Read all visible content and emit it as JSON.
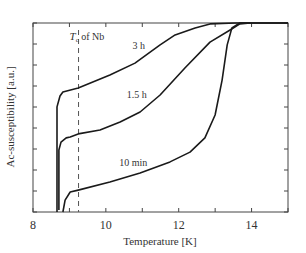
{
  "chart_data": {
    "type": "line",
    "title": "",
    "xlabel": "Temperature [K]",
    "ylabel": "Ac-susceptibility [a.u.]",
    "xlim": [
      8,
      15
    ],
    "ylim": [
      0,
      1
    ],
    "x_ticks": [
      8,
      10,
      12,
      14
    ],
    "x_minor_ticks": [
      9,
      11,
      13,
      15
    ],
    "y_ticks_count": 10,
    "y_tick_labels": [],
    "grid": false,
    "legend": null,
    "annotations": [
      {
        "text_main": "T",
        "text_sub": "c",
        "text_rest": " of Nb",
        "x": 9.25,
        "style": "vertical dashed line"
      },
      {
        "text": "3 h",
        "x": 10.9,
        "y": 0.86
      },
      {
        "text": "1.5 h",
        "x": 10.85,
        "y": 0.605
      },
      {
        "text": "10 min",
        "x": 10.75,
        "y": 0.245
      }
    ],
    "series": [
      {
        "name": "3 h",
        "points": [
          [
            8.66,
            0
          ],
          [
            8.66,
            0.556
          ],
          [
            8.74,
            0.614
          ],
          [
            8.82,
            0.635
          ],
          [
            9.24,
            0.656
          ],
          [
            10.11,
            0.725
          ],
          [
            10.8,
            0.788
          ],
          [
            11.49,
            0.884
          ],
          [
            11.9,
            0.937
          ],
          [
            12.45,
            0.974
          ],
          [
            12.86,
            0.995
          ],
          [
            13.55,
            1.0
          ],
          [
            15.0,
            1.0
          ]
        ]
      },
      {
        "name": "1.5 h",
        "points": [
          [
            8.71,
            0.01
          ],
          [
            8.71,
            0.328
          ],
          [
            8.77,
            0.37
          ],
          [
            8.91,
            0.392
          ],
          [
            9.02,
            0.397
          ],
          [
            9.24,
            0.413
          ],
          [
            9.84,
            0.434
          ],
          [
            10.39,
            0.476
          ],
          [
            10.94,
            0.529
          ],
          [
            11.49,
            0.619
          ],
          [
            12.17,
            0.762
          ],
          [
            12.86,
            0.899
          ],
          [
            13.41,
            0.963
          ],
          [
            13.68,
            0.995
          ],
          [
            13.96,
            1.0
          ]
        ]
      },
      {
        "name": "10 min",
        "points": [
          [
            8.82,
            0
          ],
          [
            8.88,
            0.063
          ],
          [
            9.02,
            0.106
          ],
          [
            9.24,
            0.116
          ],
          [
            10.11,
            0.159
          ],
          [
            10.94,
            0.206
          ],
          [
            11.76,
            0.265
          ],
          [
            12.31,
            0.317
          ],
          [
            12.72,
            0.392
          ],
          [
            13.0,
            0.513
          ],
          [
            13.19,
            0.698
          ],
          [
            13.33,
            0.884
          ],
          [
            13.46,
            0.974
          ],
          [
            13.68,
            1.0
          ],
          [
            15.0,
            1.0
          ]
        ]
      }
    ]
  },
  "labels": {
    "xlabel": "Temperature [K]",
    "ylabel": "Ac-susceptibility [a.u.]",
    "tc_T": "T",
    "tc_sub": "c",
    "tc_rest": " of Nb",
    "curve_3h": "3 h",
    "curve_15h": "1.5 h",
    "curve_10min": "10 min"
  }
}
